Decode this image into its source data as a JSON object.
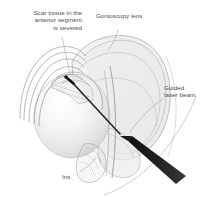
{
  "figure": {
    "width": 212,
    "height": 197,
    "background_color": "#ffffff"
  },
  "labels": {
    "scar_tissue": "Scar tissue in the\nanterior segment\nis severed",
    "gonioscopy_lens": "Gonioscopy lens",
    "guided_laser_beam": "Guided\nlaser beam",
    "iris": "Iris"
  },
  "colors": {
    "label_text": "#4b4b4d",
    "leader_line": "#9a9a9c",
    "outline": "#7e7e80",
    "lens_fill": "#efefef",
    "lens_fill_overlap": "#e2e2e2",
    "globe_light": "#fdfdfd",
    "globe_shadow": "#d8d8d8",
    "hatching": "#b6b6b8",
    "probe_dark": "#1a1a1a"
  },
  "anatomy_parts": [
    "cornea",
    "anterior-chamber-angle",
    "trabecular-meshwork",
    "iris",
    "crystalline-lens-globe",
    "sclera"
  ],
  "instruments": [
    "gonioscopy-lens",
    "laser-probe"
  ]
}
